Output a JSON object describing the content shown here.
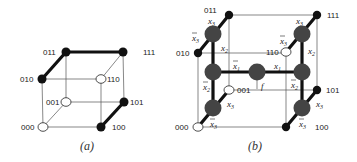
{
  "panel_a": {
    "caption": "(a)",
    "vertices": [
      {
        "id": "000",
        "label": "000",
        "filled": false
      },
      {
        "id": "001",
        "label": "001",
        "filled": false
      },
      {
        "id": "010",
        "label": "010",
        "filled": true
      },
      {
        "id": "011",
        "label": "011",
        "filled": true
      },
      {
        "id": "100",
        "label": "100",
        "filled": true
      },
      {
        "id": "101",
        "label": "101",
        "filled": true
      },
      {
        "id": "110",
        "label": "110",
        "filled": false
      },
      {
        "id": "111",
        "label": "111",
        "filled": true
      }
    ],
    "thick_edges": [
      [
        "010",
        "011"
      ],
      [
        "011",
        "111"
      ],
      [
        "100",
        "101"
      ]
    ]
  },
  "panel_b": {
    "caption": "(b)",
    "vertices": [
      {
        "id": "000",
        "label": "000",
        "filled": false
      },
      {
        "id": "001",
        "label": "001",
        "filled": false
      },
      {
        "id": "010",
        "label": "010",
        "filled": true
      },
      {
        "id": "011",
        "label": "011",
        "filled": true
      },
      {
        "id": "100",
        "label": "100",
        "filled": true
      },
      {
        "id": "101",
        "label": "101",
        "filled": true
      },
      {
        "id": "110",
        "label": "110",
        "filled": false
      },
      {
        "id": "111",
        "label": "111",
        "filled": true
      }
    ],
    "output_label": "f",
    "edge_labels": {
      "x1": "x",
      "x1_sub": "1",
      "x2": "x",
      "x2_sub": "2",
      "x3": "x",
      "x3_sub": "3"
    },
    "nodes": {
      "root": "x1",
      "left": "x2",
      "right": "x2",
      "left_top": "x3",
      "left_bottom": "x3",
      "right_top": "x3",
      "right_bottom": "x3"
    }
  }
}
